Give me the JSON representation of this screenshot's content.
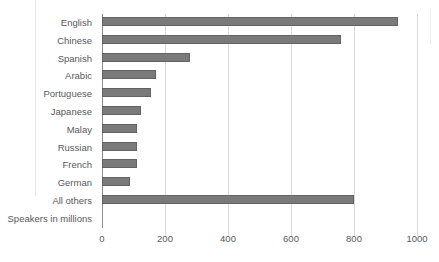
{
  "chart_data": {
    "type": "bar",
    "orientation": "horizontal",
    "title": "",
    "subtitle": "",
    "xlabel": "Speakers in millions",
    "ylabel": "",
    "xlim": [
      0,
      1000
    ],
    "xticks": [
      0,
      200,
      400,
      600,
      800,
      1000
    ],
    "xtick_labels": [
      "0",
      "200",
      "400",
      "600",
      "800",
      "1000"
    ],
    "grid": true,
    "grid_axis": "x",
    "legend": false,
    "legend_position": "none",
    "bar_color": "#7a7a7a",
    "bar_edge_color": "#636363",
    "axis_color": "#8c8c8c",
    "grid_color": "#d9d9d9",
    "text_color": "#59595b",
    "background": "#ffffff",
    "categories": [
      "English",
      "Chinese",
      "Spanish",
      "Arabic",
      "Portuguese",
      "Japanese",
      "Malay",
      "Russian",
      "French",
      "German",
      "All others"
    ],
    "values": [
      940,
      760,
      280,
      170,
      155,
      125,
      110,
      110,
      110,
      90,
      800
    ]
  },
  "axis": {
    "x_caption": "Speakers in millions",
    "ticks": [
      {
        "label": "0",
        "value": 0
      },
      {
        "label": "200",
        "value": 200
      },
      {
        "label": "400",
        "value": 400
      },
      {
        "label": "600",
        "value": 600
      },
      {
        "label": "800",
        "value": 800
      },
      {
        "label": "1000",
        "value": 1000
      }
    ]
  }
}
